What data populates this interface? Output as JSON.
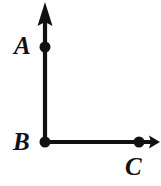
{
  "figure": {
    "type": "geometry-diagram",
    "background_color": "#ffffff",
    "stroke_color": "#111111",
    "labels": {
      "a": "A",
      "b": "B",
      "c": "C"
    },
    "points": [
      {
        "name": "A",
        "x": 45,
        "y": 47,
        "dot": true,
        "label": "A",
        "label_x": 14,
        "label_y": 33
      },
      {
        "name": "B",
        "x": 45,
        "y": 142,
        "dot": true,
        "label": "B",
        "label_x": 13,
        "label_y": 129
      },
      {
        "name": "C",
        "x": 139,
        "y": 142,
        "dot": true,
        "label": "C",
        "label_x": 125,
        "label_y": 154
      }
    ],
    "rays": [
      {
        "name": "ray-BA",
        "from": "B",
        "through": "A",
        "x1": 45,
        "y1": 142,
        "x2": 45,
        "y2": 14,
        "arrow_tip_x": 45,
        "arrow_tip_y": 2,
        "stroke_width": 4,
        "arrowhead": "large"
      },
      {
        "name": "ray-BC",
        "from": "B",
        "through": "C",
        "x1": 45,
        "y1": 142,
        "x2": 150,
        "y2": 142,
        "arrow_tip_x": 160,
        "arrow_tip_y": 142,
        "stroke_width": 4,
        "arrowhead": "small"
      }
    ],
    "dot_radius": 5.5,
    "angle_at_B_degrees": 90
  }
}
